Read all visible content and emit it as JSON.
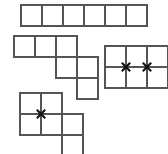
{
  "canvas": {
    "width": 168,
    "height": 154,
    "background": "#ffffff",
    "line_color": "#555558",
    "mark_color": "#111111",
    "cell_size": 21
  },
  "figures": [
    {
      "id": "figure-1",
      "name": "horizontal-strip-6",
      "description": "Row of six squares in a single horizontal line",
      "x": 20,
      "y": 4,
      "cols": 6,
      "rows": 1,
      "cells": [
        [
          0,
          0
        ],
        [
          1,
          0
        ],
        [
          2,
          0
        ],
        [
          3,
          0
        ],
        [
          4,
          0
        ],
        [
          5,
          0
        ]
      ],
      "marks": []
    },
    {
      "id": "figure-2",
      "name": "descending-staircase-6",
      "description": "Staircase of six squares descending to the right",
      "x": 13,
      "y": 35,
      "cols": 4,
      "rows": 3,
      "cells": [
        [
          0,
          0
        ],
        [
          1,
          0
        ],
        [
          2,
          0
        ],
        [
          2,
          1
        ],
        [
          3,
          1
        ],
        [
          3,
          2
        ]
      ],
      "marks": []
    },
    {
      "id": "figure-3",
      "name": "rectangle-3x2-marked",
      "description": "Three by two rectangle of squares with two X marks on the middle row gridline",
      "x": 104,
      "y": 45,
      "cols": 3,
      "rows": 2,
      "cells": [
        [
          0,
          0
        ],
        [
          1,
          0
        ],
        [
          2,
          0
        ],
        [
          0,
          1
        ],
        [
          1,
          1
        ],
        [
          2,
          1
        ]
      ],
      "marks": [
        [
          1,
          1
        ],
        [
          2,
          1
        ]
      ]
    },
    {
      "id": "figure-4",
      "name": "staircase-6-marked",
      "description": "Six square stepped shape with one X mark at an interior vertex",
      "x": 19,
      "y": 92,
      "cols": 3,
      "rows": 3,
      "cells": [
        [
          0,
          0
        ],
        [
          1,
          0
        ],
        [
          0,
          1
        ],
        [
          1,
          1
        ],
        [
          2,
          1
        ],
        [
          2,
          2
        ]
      ],
      "marks": [
        [
          1,
          1
        ]
      ]
    }
  ]
}
